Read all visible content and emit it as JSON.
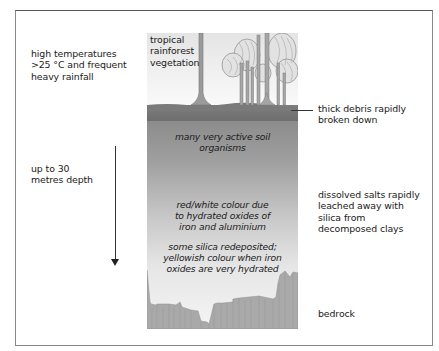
{
  "diagram": {
    "type": "soil-profile"
  },
  "left_labels": {
    "climate": "high temperatures\n>25 °C and frequent\nheavy rainfall",
    "depth": "up to 30\nmetres depth"
  },
  "column_labels": {
    "vegetation": "tropical\nrainforest\nvegetation",
    "organisms": "many very active soil\norganisms",
    "colour": "red/white colour due\nto hydrated oxides of\niron and aluminium",
    "silica": "some silica redeposited;\nyellowish colour when iron\noxides are very hydrated"
  },
  "right_labels": {
    "debris": "thick debris rapidly\nbroken down",
    "leaching": "dissolved salts rapidly\nleached away with\nsilica from\ndecomposed clays",
    "bedrock": "bedrock"
  },
  "colors": {
    "frame": "#888888",
    "debris_layer": "#767676",
    "upper_soil": "#8c8c8c",
    "lower_soil": "#f4f4f4",
    "bedrock": "#a9a9a9",
    "text": "#1a1a1a"
  },
  "arrow": {
    "direction": "down",
    "meaning": "depth"
  }
}
